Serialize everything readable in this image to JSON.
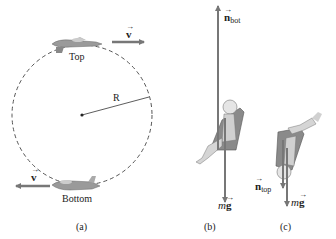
{
  "figure": {
    "panels": [
      {
        "id": "a",
        "caption": "(a)",
        "circle_label_radius": "R",
        "top_label": "Top",
        "bottom_label": "Bottom",
        "velocity_symbol": "v",
        "top_velocity_direction": "right",
        "bottom_velocity_direction": "left"
      },
      {
        "id": "b",
        "caption": "(b)",
        "normal_force": {
          "symbol": "n",
          "subscript": "bot",
          "direction": "up"
        },
        "weight": {
          "m": "m",
          "g": "g",
          "direction": "down"
        }
      },
      {
        "id": "c",
        "caption": "(c)",
        "normal_force": {
          "symbol": "n",
          "subscript": "top",
          "direction": "down"
        },
        "weight": {
          "m": "m",
          "g": "g",
          "direction": "down"
        }
      }
    ],
    "colors": {
      "arrow": "#777777",
      "dashed_circle": "#555555",
      "text": "#222222",
      "seat": "#8a8a8a",
      "pilot": "#cfcfcf"
    }
  }
}
